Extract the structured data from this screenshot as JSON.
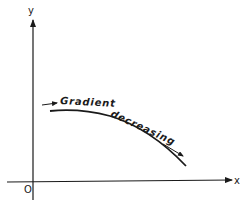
{
  "diagram": {
    "type": "curve-on-axes",
    "axes": {
      "x_label": "x",
      "y_label": "y",
      "origin_label": "O"
    },
    "curve": {
      "description": "Concave-down curve with decreasing gradient",
      "annotation_words": [
        "Gradient",
        "decreasing"
      ]
    },
    "arrows": [
      {
        "name": "start-arrow",
        "direction": "right"
      },
      {
        "name": "end-arrow",
        "direction": "down-right"
      }
    ],
    "colors": {
      "ink": "#1a1a1a",
      "background": "#ffffff"
    }
  }
}
